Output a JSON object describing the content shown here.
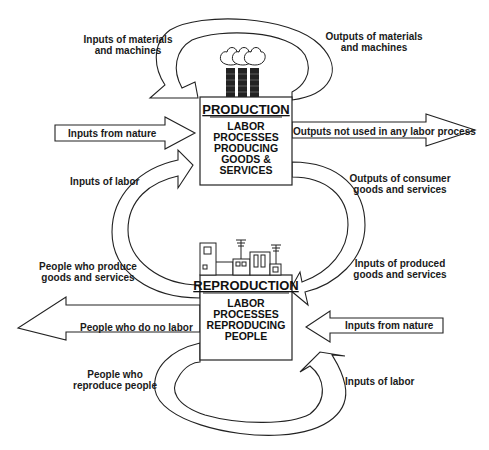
{
  "diagram": {
    "production": {
      "title": "PRODUCTION",
      "lines": [
        "LABOR",
        "PROCESSES",
        "PRODUCING",
        "GOODS &",
        "SERVICES"
      ],
      "icon": "factory-icon"
    },
    "reproduction": {
      "title": "REPRODUCTION",
      "lines": [
        "LABOR",
        "PROCESSES",
        "REPRODUCING",
        "PEOPLE"
      ],
      "icon": "houses-icon"
    },
    "labels": {
      "inputs_materials": [
        "Inputs of materials",
        "and machines"
      ],
      "outputs_materials": [
        "Outputs of materials",
        "and machines"
      ],
      "inputs_nature_top": "Inputs from nature",
      "outputs_not_used": "Outputs not used in any labor process",
      "inputs_labor_top": "Inputs of labor",
      "outputs_consumer": [
        "Outputs of consumer",
        "goods and services"
      ],
      "people_produce": [
        "People who produce",
        "goods and services"
      ],
      "inputs_produced": [
        "Inputs of produced",
        "goods and services"
      ],
      "people_no_labor": "People who do no labor",
      "inputs_nature_bottom": "Inputs from nature",
      "people_reproduce": [
        "People who",
        "reproduce people"
      ],
      "inputs_labor_bottom": "Inputs of labor"
    },
    "colors": {
      "stroke": "#222222",
      "fill": "#ffffff",
      "text": "#1a1a1a"
    }
  }
}
